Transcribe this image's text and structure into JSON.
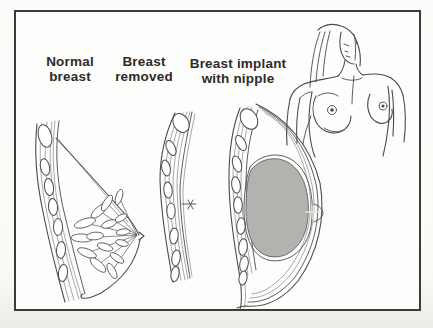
{
  "figure": {
    "kind": "medical-illustration",
    "panels": [
      {
        "id": "normal-breast",
        "label_line1": "Normal",
        "label_line2": "breast"
      },
      {
        "id": "breast-removed",
        "label_line1": "Breast",
        "label_line2": "removed"
      },
      {
        "id": "breast-implant",
        "label_line1": "Breast implant",
        "label_line2": "with nipple"
      }
    ],
    "illustrations": [
      {
        "name": "normal-breast-cross-section"
      },
      {
        "name": "mastectomy-chest-wall-cross-section"
      },
      {
        "name": "breast-implant-cross-section"
      },
      {
        "name": "female-torso-front-view"
      }
    ],
    "colors": {
      "paper": "#fbfaf7",
      "panel_background": "#fdfdfb",
      "frame_border": "#3b3b3b",
      "line_art": "#4b4b4d",
      "implant_fill": "#b5b4b1",
      "implant_dot": "#a19f9c",
      "label_text": "#2e2b28"
    }
  }
}
